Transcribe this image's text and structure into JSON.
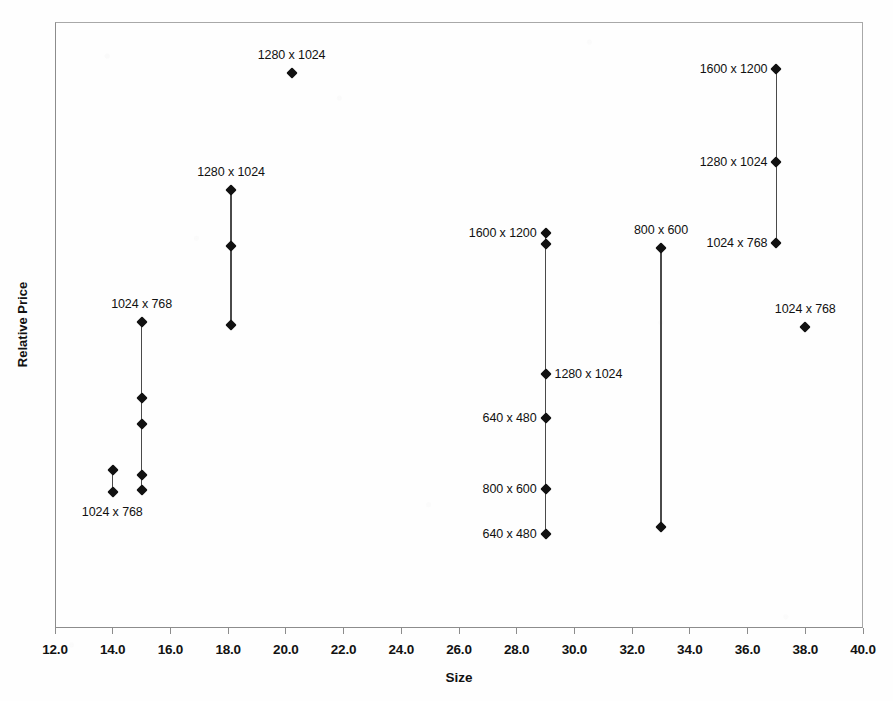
{
  "chart_data": {
    "type": "scatter",
    "title": "",
    "xlabel": "Size",
    "ylabel": "Relative Price",
    "xlim": [
      12.0,
      40.0
    ],
    "xticks": [
      "12.0",
      "14.0",
      "16.0",
      "18.0",
      "20.0",
      "22.0",
      "24.0",
      "26.0",
      "28.0",
      "30.0",
      "32.0",
      "34.0",
      "36.0",
      "38.0",
      "40.0"
    ],
    "ylim": [
      0,
      100
    ],
    "yticks": [],
    "grid": false,
    "legend": false,
    "marker_color": "#111111",
    "line_color": "#4a4a4a",
    "axis_color": "#8c8c8c",
    "groups": [
      {
        "name": "group-14",
        "x": 14.0,
        "connected": true,
        "points": [
          {
            "y": 26.1,
            "label": "",
            "label_pos": "none"
          },
          {
            "y": 22.5,
            "label": "1024 x 768",
            "label_pos": "below-left"
          }
        ]
      },
      {
        "name": "group-15",
        "x": 15.0,
        "connected": true,
        "points": [
          {
            "y": 50.5,
            "label": "1024 x 768",
            "label_pos": "above"
          },
          {
            "y": 38.0,
            "label": "",
            "label_pos": "none"
          },
          {
            "y": 33.7,
            "label": "",
            "label_pos": "none"
          },
          {
            "y": 25.2,
            "label": "",
            "label_pos": "none"
          },
          {
            "y": 22.7,
            "label": "",
            "label_pos": "none"
          }
        ]
      },
      {
        "name": "group-18",
        "x": 18.1,
        "connected": true,
        "points": [
          {
            "y": 72.2,
            "label": "1280 x 1024",
            "label_pos": "above"
          },
          {
            "y": 63.0,
            "label": "",
            "label_pos": "none"
          },
          {
            "y": 50.0,
            "label": "",
            "label_pos": "none"
          }
        ]
      },
      {
        "name": "group-20",
        "x": 20.2,
        "connected": false,
        "points": [
          {
            "y": 91.6,
            "label": "1280 x 1024",
            "label_pos": "above"
          }
        ]
      },
      {
        "name": "group-29",
        "x": 29.0,
        "connected": true,
        "points": [
          {
            "y": 65.1,
            "label": "1600 x 1200",
            "label_pos": "left"
          },
          {
            "y": 63.3,
            "label": "",
            "label_pos": "none"
          },
          {
            "y": 41.9,
            "label": "1280 x 1024",
            "label_pos": "right"
          },
          {
            "y": 34.7,
            "label": "640 x 480",
            "label_pos": "left"
          },
          {
            "y": 22.9,
            "label": "800 x 600",
            "label_pos": "left"
          },
          {
            "y": 15.5,
            "label": "640 x 480",
            "label_pos": "left"
          }
        ]
      },
      {
        "name": "group-33",
        "x": 33.0,
        "connected": true,
        "points": [
          {
            "y": 62.7,
            "label": "800 x 600",
            "label_pos": "above"
          },
          {
            "y": 16.6,
            "label": "",
            "label_pos": "none"
          }
        ]
      },
      {
        "name": "group-37",
        "x": 37.0,
        "connected": true,
        "points": [
          {
            "y": 92.3,
            "label": "1600 x 1200",
            "label_pos": "left"
          },
          {
            "y": 76.9,
            "label": "1280 x 1024",
            "label_pos": "left"
          },
          {
            "y": 63.5,
            "label": "1024 x 768",
            "label_pos": "left"
          }
        ]
      },
      {
        "name": "group-38",
        "x": 38.0,
        "connected": false,
        "points": [
          {
            "y": 49.6,
            "label": "1024 x 768",
            "label_pos": "above"
          }
        ]
      }
    ]
  }
}
